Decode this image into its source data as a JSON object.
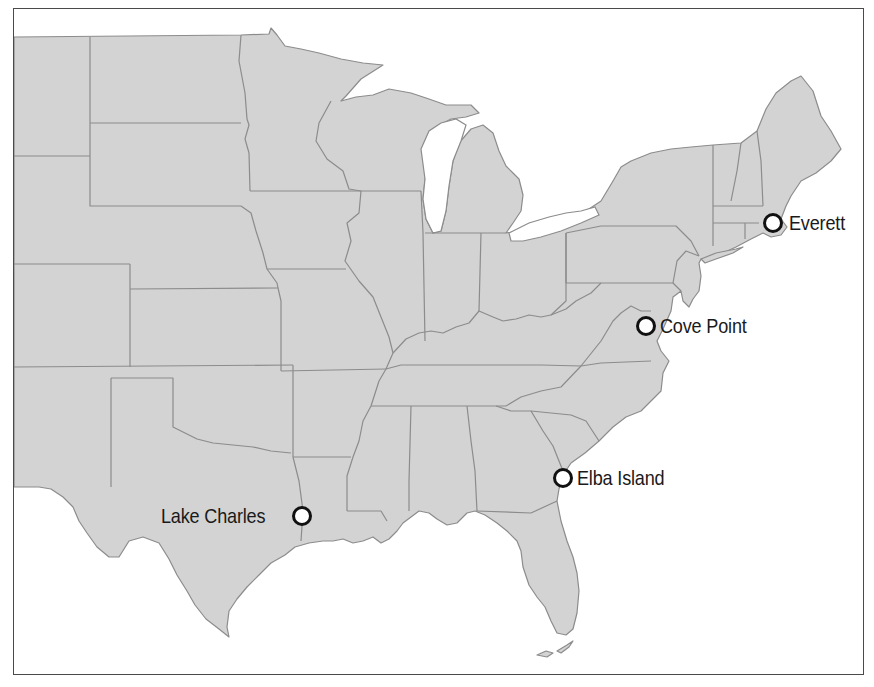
{
  "map": {
    "title": "",
    "region": "Eastern and Central United States",
    "colors": {
      "land": "#d3d3d3",
      "state_border": "#8c8c8c",
      "water": "#ffffff",
      "frame": "#4a4a4a",
      "marker_stroke": "#111111",
      "label_text": "#1a1a1a"
    },
    "markers": [
      {
        "id": "everett",
        "label": "Everett",
        "icon": "circle-marker-icon",
        "x": 772,
        "y": 222,
        "label_side": "right"
      },
      {
        "id": "cove-point",
        "label": "Cove Point",
        "icon": "circle-marker-icon",
        "x": 645,
        "y": 325,
        "label_side": "right"
      },
      {
        "id": "elba-island",
        "label": "Elba Island",
        "icon": "circle-marker-icon",
        "x": 562,
        "y": 477,
        "label_side": "right"
      },
      {
        "id": "lake-charles",
        "label": "Lake Charles",
        "icon": "circle-marker-icon",
        "x": 301,
        "y": 515,
        "label_side": "left"
      }
    ]
  }
}
